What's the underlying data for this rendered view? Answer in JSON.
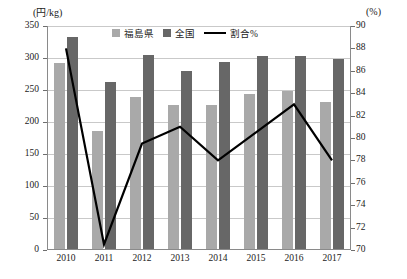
{
  "chart_data": {
    "type": "bar",
    "title": "",
    "xlabel": "",
    "ylabel": "(円/kg)",
    "y2label": "(%)",
    "categories": [
      "2010",
      "2011",
      "2012",
      "2013",
      "2014",
      "2015",
      "2016",
      "2017"
    ],
    "ylim": [
      0,
      350
    ],
    "y_ticks": [
      0,
      50,
      100,
      150,
      200,
      250,
      300,
      350
    ],
    "y2lim": [
      70,
      90
    ],
    "y2_ticks": [
      70,
      72,
      74,
      76,
      78,
      80,
      82,
      84,
      86,
      88,
      90
    ],
    "grid": true,
    "legend_position": "top-center",
    "series": [
      {
        "name": "福島県",
        "type": "bar",
        "axis": "left",
        "color": "#a9a9a9",
        "values": [
          292,
          186,
          239,
          227,
          226,
          243,
          249,
          232
        ]
      },
      {
        "name": "全国",
        "type": "bar",
        "axis": "left",
        "color": "#676767",
        "values": [
          333,
          262,
          304,
          279,
          293,
          303,
          303,
          299
        ]
      },
      {
        "name": "割合%",
        "type": "line",
        "axis": "right",
        "color": "#000000",
        "values": [
          88.0,
          70.5,
          79.5,
          81.0,
          78.0,
          80.5,
          83.0,
          78.0
        ]
      }
    ]
  },
  "legend": {
    "items": [
      {
        "label": "福島県",
        "marker": "square"
      },
      {
        "label": "全国",
        "marker": "square"
      },
      {
        "label": "割合%",
        "marker": "line"
      }
    ]
  }
}
